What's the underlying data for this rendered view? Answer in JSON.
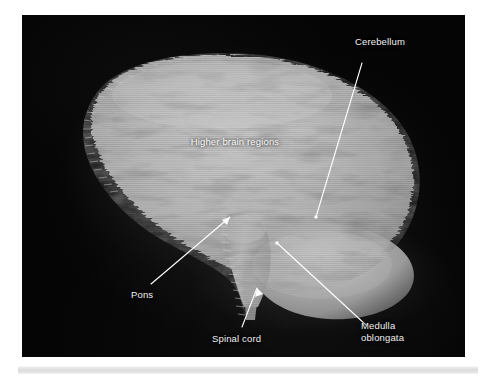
{
  "figure": {
    "kind": "mri-volume-rendering",
    "background_color": "#050505",
    "label_color": "#f2f2f2",
    "leader_color": "#ffffff",
    "tissue_color": "#b9b9b9"
  },
  "panel": {
    "x": 22,
    "y": 15,
    "width": 443,
    "height": 342
  },
  "annotations": [
    {
      "id": "cerebellum",
      "label": "Cerebellum",
      "align": "center",
      "label_x": 341,
      "label_y": 36,
      "leader": {
        "x1": 362,
        "y1": 63,
        "x2": 316,
        "y2": 217
      },
      "arrowhead": false
    },
    {
      "id": "higher-brain-regions",
      "label": "Higher brain regions",
      "align": "center",
      "label_x": 192,
      "label_y": 136,
      "leader": null,
      "arrowhead": false
    },
    {
      "id": "pons",
      "label": "Pons",
      "align": "left",
      "label_x": 131,
      "label_y": 289,
      "leader": {
        "x1": 151,
        "y1": 284,
        "x2": 230,
        "y2": 217
      },
      "arrowhead": true
    },
    {
      "id": "spinal-cord",
      "label": "Spinal cord",
      "align": "left",
      "label_x": 212,
      "label_y": 333,
      "leader": {
        "x1": 242,
        "y1": 327,
        "x2": 257,
        "y2": 288
      },
      "arrowhead": true
    },
    {
      "id": "medulla-oblongata",
      "label": "Medulla\noblongata",
      "align": "left",
      "label_x": 361,
      "label_y": 320,
      "leader": {
        "x1": 366,
        "y1": 325,
        "x2": 277,
        "y2": 243
      },
      "arrowhead": false
    }
  ],
  "bottom_rule": {
    "x": 18,
    "y": 366,
    "width": 460,
    "height": 8,
    "color": "#dcdcdc"
  }
}
